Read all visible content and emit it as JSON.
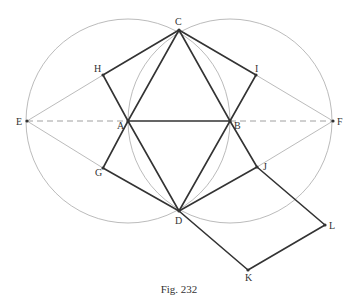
{
  "figure": {
    "caption": "Fig. 232",
    "colors": {
      "heavy_line": "#333333",
      "construction_line": "#aaaaaa",
      "dashed_line": "#888888",
      "label": "#333333"
    },
    "points": {
      "A": {
        "x": 128,
        "y": 121,
        "label": "A"
      },
      "B": {
        "x": 230,
        "y": 121,
        "label": "B"
      },
      "C": {
        "x": 179,
        "y": 30,
        "label": "C"
      },
      "D": {
        "x": 179,
        "y": 211,
        "label": "D"
      },
      "E": {
        "x": 27,
        "y": 121,
        "label": "E"
      },
      "F": {
        "x": 333,
        "y": 121,
        "label": "F"
      },
      "G": {
        "x": 103,
        "y": 168,
        "label": "G"
      },
      "H": {
        "x": 103,
        "y": 75,
        "label": "H"
      },
      "I": {
        "x": 256,
        "y": 75,
        "label": "I"
      },
      "J": {
        "x": 257,
        "y": 167,
        "label": "J"
      },
      "K": {
        "x": 248,
        "y": 270,
        "label": "K"
      },
      "L": {
        "x": 325,
        "y": 225,
        "label": "L"
      }
    },
    "circles": [
      {
        "name": "circle-centered-A",
        "cx": 128,
        "cy": 121,
        "r": 102
      },
      {
        "name": "circle-centered-B",
        "cx": 230,
        "cy": 121,
        "r": 102
      }
    ],
    "heavy_segments": [
      [
        "A",
        "B"
      ],
      [
        "A",
        "C"
      ],
      [
        "B",
        "C"
      ],
      [
        "A",
        "D"
      ],
      [
        "B",
        "D"
      ],
      [
        "C",
        "H"
      ],
      [
        "H",
        "A"
      ],
      [
        "C",
        "I"
      ],
      [
        "I",
        "B"
      ],
      [
        "A",
        "G"
      ],
      [
        "G",
        "D"
      ],
      [
        "B",
        "J"
      ],
      [
        "J",
        "D"
      ],
      [
        "J",
        "L"
      ],
      [
        "D",
        "K"
      ],
      [
        "K",
        "L"
      ]
    ],
    "thin_segments": [
      [
        "E",
        "H"
      ],
      [
        "E",
        "G"
      ],
      [
        "F",
        "I"
      ],
      [
        "F",
        "J"
      ]
    ],
    "dashed_segments": [
      [
        "E",
        "A"
      ],
      [
        "B",
        "F"
      ]
    ]
  }
}
